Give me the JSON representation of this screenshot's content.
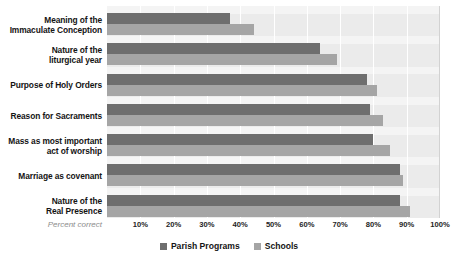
{
  "chart_data": {
    "type": "bar",
    "orientation": "horizontal",
    "title": "",
    "subtitle": "",
    "xlabel": "Percent correct",
    "ylabel": "",
    "xlim": [
      0,
      100
    ],
    "xticks": [
      "10%",
      "20%",
      "30%",
      "40%",
      "50%",
      "60%",
      "70%",
      "80%",
      "90%",
      "100%"
    ],
    "xtick_values": [
      10,
      20,
      30,
      40,
      50,
      60,
      70,
      80,
      90,
      100
    ],
    "grid": true,
    "legend_position": "bottom-center",
    "categories": [
      "Meaning of the Immaculate Conception",
      "Nature of the liturgical year",
      "Purpose of Holy Orders",
      "Reason for Sacraments",
      "Mass as most important act of worship",
      "Marriage as covenant",
      "Nature of the Real Presence"
    ],
    "category_lines": [
      [
        "Meaning of the",
        "Immaculate Conception"
      ],
      [
        "Nature of the",
        "liturgical year"
      ],
      [
        "Purpose of Holy Orders"
      ],
      [
        "Reason for Sacraments"
      ],
      [
        "Mass as most important",
        "act of worship"
      ],
      [
        "Marriage as covenant"
      ],
      [
        "Nature of the",
        "Real Presence"
      ]
    ],
    "series": [
      {
        "name": "Parish Programs",
        "color": "#6e6e6e",
        "values": [
          37,
          64,
          78,
          79,
          80,
          88,
          88
        ]
      },
      {
        "name": "Schools",
        "color": "#a5a5a5",
        "values": [
          44,
          69,
          81,
          83,
          85,
          89,
          91
        ]
      }
    ]
  },
  "legend": {
    "items": [
      {
        "label": "Parish Programs",
        "color": "#6e6e6e"
      },
      {
        "label": "Schools",
        "color": "#a5a5a5"
      }
    ]
  },
  "axis": {
    "caption": "Percent correct"
  },
  "colors": {
    "plot_background": "#ebebeb",
    "band_background": "#f4f4f4",
    "gridline": "#ffffff",
    "series_a": "#6e6e6e",
    "series_b": "#a5a5a5",
    "text": "#141414",
    "caption_text": "#8c8c8c"
  }
}
